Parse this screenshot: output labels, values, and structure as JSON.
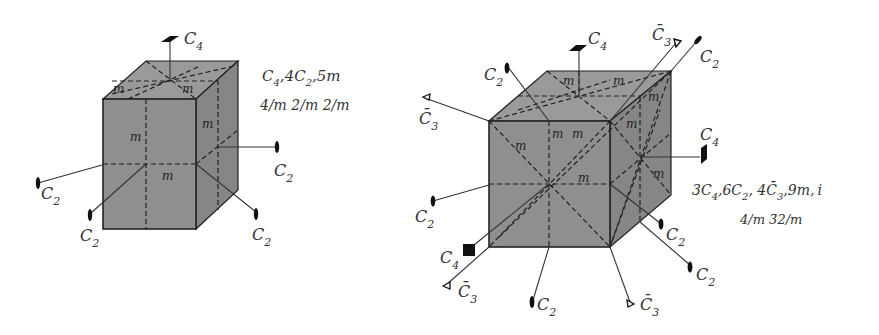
{
  "left_figure": {
    "name": "tetragonal prism",
    "symmetry_elements": "C4, 4C2, 5m",
    "symmetry_elements_parts": {
      "a": "C",
      "a_sub": "4",
      "b": ",4C",
      "b_sub": "2",
      "c": ",5m"
    },
    "point_group": "4/m 2/m 2/m",
    "axis_labels": {
      "top": {
        "base": "C",
        "sub": "4"
      },
      "right": {
        "base": "C",
        "sub": "2"
      },
      "left": {
        "base": "C",
        "sub": "2"
      },
      "bottom_left": {
        "base": "C",
        "sub": "2"
      },
      "bottom_right": {
        "base": "C",
        "sub": "2"
      }
    },
    "mirror_label": "m"
  },
  "right_figure": {
    "name": "cube",
    "symmetry_elements_parts": {
      "a": "3C",
      "a_sub": "4",
      "b": ",6C",
      "b_sub": "2",
      "c": ", 4",
      "d": "C̄",
      "d_sub": "3",
      "e": ",9m,",
      "f": "i"
    },
    "point_group": "4/m 3̄2/m",
    "axis_labels": {
      "top_c4": {
        "base": "C",
        "sub": "4"
      },
      "top_c3bar": {
        "base": "C̄",
        "sub": "3"
      },
      "top_right_c2": {
        "base": "C",
        "sub": "2"
      },
      "top_left_c2": {
        "base": "C",
        "sub": "2"
      },
      "left_c3bar": {
        "base": "C̄",
        "sub": "3"
      },
      "right_c4": {
        "base": "C",
        "sub": "4"
      },
      "left_c2": {
        "base": "C",
        "sub": "2"
      },
      "bottom_left_c4": {
        "base": "C",
        "sub": "4"
      },
      "bottom_left_c3bar": {
        "base": "C̄",
        "sub": "3"
      },
      "bottom_c2": {
        "base": "C",
        "sub": "2"
      },
      "bottom_c3bar": {
        "base": "C̄",
        "sub": "3"
      },
      "right_c2_a": {
        "base": "C",
        "sub": "2"
      },
      "right_c2_b": {
        "base": "C",
        "sub": "2"
      }
    },
    "mirror_label": "m"
  }
}
